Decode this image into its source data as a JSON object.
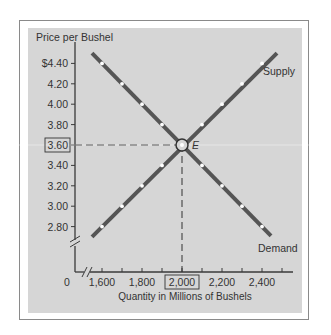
{
  "chart_data": {
    "type": "line",
    "title": "",
    "ylabel": "Price per Bushel",
    "xlabel": "Quantity in Millions of Bushels",
    "xlim": [
      1500,
      2550
    ],
    "ylim": [
      2.55,
      4.55
    ],
    "x_origin_label": "0",
    "x_ticks": [
      1600,
      1700,
      1800,
      1900,
      2000,
      2100,
      2200,
      2300,
      2400,
      2500
    ],
    "x_tick_labels": [
      {
        "value": 1600,
        "label": "1,600"
      },
      {
        "value": 1800,
        "label": "1,800"
      },
      {
        "value": 2000,
        "label": "2,000",
        "boxed": true
      },
      {
        "value": 2200,
        "label": "2,200"
      },
      {
        "value": 2400,
        "label": "2,400"
      }
    ],
    "y_ticks": [
      {
        "value": 4.4,
        "label": "$4.40"
      },
      {
        "value": 4.2,
        "label": "4.20"
      },
      {
        "value": 4.0,
        "label": "4.00"
      },
      {
        "value": 3.8,
        "label": "3.80"
      },
      {
        "value": 3.6,
        "label": "3.60",
        "boxed": true
      },
      {
        "value": 3.4,
        "label": "3.40"
      },
      {
        "value": 3.2,
        "label": "3.20"
      },
      {
        "value": 3.0,
        "label": "3.00"
      },
      {
        "value": 2.8,
        "label": "2.80"
      }
    ],
    "series": [
      {
        "name": "Supply",
        "color": "#555555",
        "x": [
          1550,
          2475
        ],
        "y": [
          2.7,
          4.5
        ],
        "markers_x": [
          1600,
          1700,
          1800,
          1900,
          2100,
          2200,
          2300,
          2400
        ],
        "markers_y": [
          2.8,
          3.0,
          3.2,
          3.4,
          3.8,
          4.0,
          4.2,
          4.4
        ]
      },
      {
        "name": "Demand",
        "color": "#555555",
        "x": [
          1550,
          2445
        ],
        "y": [
          4.5,
          2.71
        ],
        "markers_x": [
          1600,
          1700,
          1800,
          1900,
          2100,
          2200,
          2300,
          2400
        ],
        "markers_y": [
          4.4,
          4.2,
          4.0,
          3.8,
          3.4,
          3.2,
          3.0,
          2.8
        ]
      }
    ],
    "equilibrium": {
      "label": "E",
      "x": 2000,
      "y": 3.6
    },
    "annotations": [
      {
        "text": "Supply",
        "near_series": "Supply",
        "position": "upper-right"
      },
      {
        "text": "Demand",
        "near_series": "Demand",
        "position": "lower-right"
      }
    ],
    "axis_breaks": [
      "x",
      "y"
    ],
    "background_color": "#d6d6d6",
    "grid": false,
    "legend": "none"
  }
}
